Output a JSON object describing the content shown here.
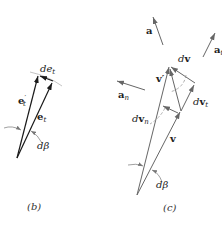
{
  "figure_b": {
    "caption": "(b)",
    "labels": {
      "de_t": "de",
      "de_t_sub": "t",
      "e_t_prime": "e",
      "e_t_prime_sub": "t",
      "e_t_prime_mark": "′",
      "e_t": "e",
      "e_t_sub": "t",
      "dbeta": "dβ"
    }
  },
  "figure_c": {
    "caption": "(c)",
    "labels": {
      "a": "a",
      "a_t": "a",
      "a_t_sub": "t",
      "a_n": "a",
      "a_n_sub": "n",
      "dv": "dv",
      "v_prime": "v′",
      "dv_t": "dv",
      "dv_t_sub": "t",
      "dv_n": "dv",
      "dv_n_sub": "n",
      "v": "v",
      "dbeta": "dβ"
    }
  },
  "colors": {
    "line_b": "#1a1a1a",
    "line_c": "#666666",
    "dashed": "#999999",
    "text": "#222222"
  }
}
